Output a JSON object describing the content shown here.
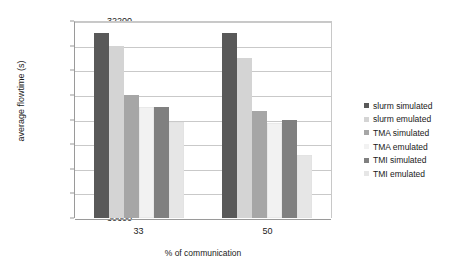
{
  "chart_data": {
    "type": "bar",
    "title": "",
    "subtitle": "",
    "xlabel": "% of communication",
    "ylabel": "average flowtime (s)",
    "categories": [
      "33",
      "50"
    ],
    "ylim": [
      30600,
      32200
    ],
    "ytick_step": 200,
    "yticks": [
      32200,
      32000,
      31800,
      31600,
      31400,
      31200,
      31000,
      30800,
      30600
    ],
    "grid": true,
    "legend_position": "right",
    "series": [
      {
        "name": "slurm simulated",
        "color": "#595959",
        "values": [
          32100,
          32100
        ]
      },
      {
        "name": "slurm emulated",
        "color": "#d4d4d4",
        "values": [
          32000,
          31900
        ]
      },
      {
        "name": "TMA simulated",
        "color": "#a6a6a6",
        "values": [
          31600,
          31470
        ]
      },
      {
        "name": "TMA emulated",
        "color": "#f2f2f2",
        "values": [
          31500,
          31370
        ]
      },
      {
        "name": "TMI simulated",
        "color": "#808080",
        "values": [
          31500,
          31400
        ]
      },
      {
        "name": "TMI emulated",
        "color": "#e6e6e6",
        "values": [
          31380,
          31110
        ]
      }
    ]
  },
  "axis": {
    "y_title": "average flowtime (s)",
    "x_title": "% of communication"
  },
  "colors": {
    "gridline": "#c9c9c9",
    "axis": "#9a9a9a",
    "text": "#1a1a1a",
    "background": "#ffffff"
  }
}
